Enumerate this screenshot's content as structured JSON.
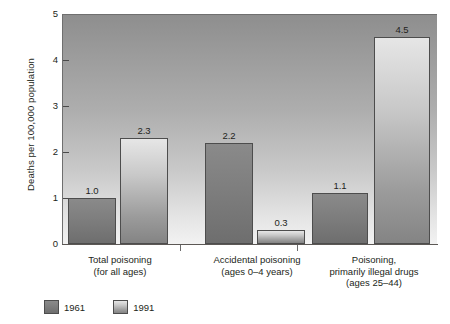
{
  "chart_data": {
    "type": "bar",
    "title": "",
    "xlabel": "",
    "ylabel": "Deaths per 100,000 population",
    "ylim": [
      0,
      5
    ],
    "yticks": [
      "0",
      "1",
      "2",
      "3",
      "4",
      "5"
    ],
    "grid": false,
    "legend_position": "bottom-left",
    "categories": [
      "Total poisoning (for all ages)",
      "Accidental poisoning (ages 0–4 years)",
      "Poisoning, primarily illegal drugs (ages 25–44)"
    ],
    "category_lines": [
      [
        "Total poisoning",
        "(for all ages)"
      ],
      [
        "Accidental poisoning",
        "(ages 0–4 years)"
      ],
      [
        "Poisoning,",
        "primarily illegal drugs",
        "(ages 25–44)"
      ]
    ],
    "series": [
      {
        "name": "1961",
        "values": [
          1.0,
          2.2,
          1.1
        ],
        "labels": [
          "1.0",
          "2.2",
          "1.1"
        ],
        "color": "#7e7e7e"
      },
      {
        "name": "1991",
        "values": [
          2.3,
          0.3,
          4.5
        ],
        "labels": [
          "2.3",
          "0.3",
          "4.5"
        ],
        "color": "#c8c8c8"
      }
    ]
  },
  "legend": {
    "items": [
      {
        "label": "1961"
      },
      {
        "label": "1991"
      }
    ]
  },
  "axis": {
    "y_label": "Deaths per 100,000 population",
    "y_ticks": [
      "5",
      "4",
      "3",
      "2",
      "1",
      "0"
    ]
  },
  "colors": {
    "plot_bg_top": "#8e8e8e",
    "plot_bg_bottom": "#f2f2f2",
    "bar_1961": "#7e7e7e",
    "bar_1991": "#c8c8c8",
    "text": "#231f20",
    "axis": "#5c5855"
  }
}
